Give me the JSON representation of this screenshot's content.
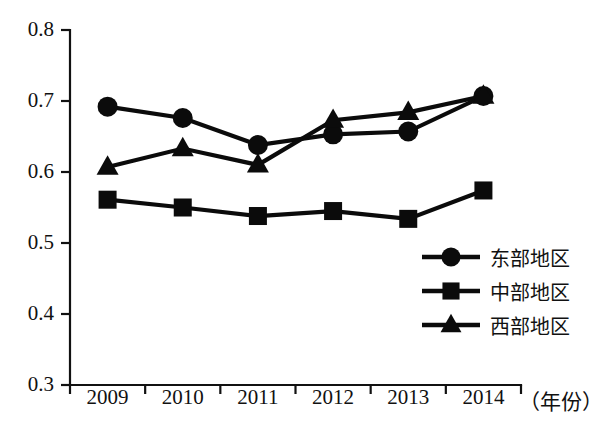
{
  "chart_data": {
    "type": "line",
    "title": "",
    "xlabel": "（年份）",
    "ylabel": "",
    "categories": [
      "2009",
      "2010",
      "2011",
      "2012",
      "2013",
      "2014"
    ],
    "ylim": [
      0.3,
      0.8
    ],
    "yticks": [
      "0.3",
      "0.4",
      "0.5",
      "0.6",
      "0.7",
      "0.8"
    ],
    "ytick_values": [
      0.3,
      0.4,
      0.5,
      0.6,
      0.7,
      0.8
    ],
    "grid": false,
    "legend_position": "center-right",
    "series": [
      {
        "name": "东部地区",
        "marker": "circle",
        "color": "#0b0b0b",
        "values": [
          0.692,
          0.676,
          0.638,
          0.653,
          0.657,
          0.707
        ]
      },
      {
        "name": "中部地区",
        "marker": "square",
        "color": "#0b0b0b",
        "values": [
          0.561,
          0.55,
          0.538,
          0.545,
          0.534,
          0.574
        ]
      },
      {
        "name": "西部地区",
        "marker": "triangle",
        "color": "#0b0b0b",
        "values": [
          0.607,
          0.633,
          0.61,
          0.673,
          0.684,
          0.707
        ]
      }
    ]
  },
  "axis": {
    "y_labels": [
      "0.8",
      "0.7",
      "0.6",
      "0.5",
      "0.4",
      "0.3"
    ],
    "x_labels": [
      "2009",
      "2010",
      "2011",
      "2012",
      "2013",
      "2014"
    ],
    "x_title": "（年份）"
  },
  "legend": {
    "items": [
      {
        "label": "东部地区",
        "marker": "circle"
      },
      {
        "label": "中部地区",
        "marker": "square"
      },
      {
        "label": "西部地区",
        "marker": "triangle"
      }
    ]
  }
}
